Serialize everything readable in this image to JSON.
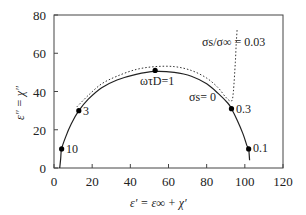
{
  "chart_data": {
    "type": "line",
    "title": "",
    "xlabel": "ε′ = ε∞ + χ′",
    "ylabel": "ε″ = χ″",
    "xlim": [
      0,
      120
    ],
    "ylim": [
      0,
      80
    ],
    "xticks": [
      0,
      20,
      40,
      60,
      80,
      100,
      120
    ],
    "yticks": [
      0,
      20,
      40,
      60,
      80
    ],
    "grid": false,
    "legend": "none",
    "series": [
      {
        "name": "σs = 0",
        "style": "solid",
        "x": [
          3,
          3.5,
          4,
          6,
          9,
          13,
          18,
          25,
          33,
          43,
          53,
          63,
          72,
          80,
          86,
          91,
          93,
          96,
          99,
          101,
          102,
          102.5
        ],
        "y": [
          0,
          5,
          10,
          16,
          23,
          30,
          36,
          42,
          46,
          49,
          50.5,
          50,
          48,
          44,
          39,
          34,
          31,
          25,
          18,
          12,
          10,
          4
        ]
      },
      {
        "name": "σs/σ∞ = 0.03",
        "style": "dotted",
        "x": [
          12,
          18,
          25,
          33,
          43,
          53,
          63,
          72,
          80,
          86,
          90,
          93,
          94,
          95,
          95.5,
          96
        ],
        "y": [
          32,
          38,
          44,
          48,
          51.5,
          53,
          53,
          51,
          47,
          42,
          37,
          35,
          40,
          55,
          65,
          73
        ]
      }
    ],
    "markers": [
      {
        "label": "10",
        "x": 4,
        "y": 10
      },
      {
        "label": "3",
        "x": 13,
        "y": 30
      },
      {
        "label": "ωτD=1",
        "x": 53,
        "y": 51
      },
      {
        "label": "0.3",
        "x": 93,
        "y": 31
      },
      {
        "label": "0.1",
        "x": 102,
        "y": 10
      }
    ],
    "annotations": [
      {
        "text": "σs/σ∞ = 0.03",
        "x": 82,
        "y": 65
      },
      {
        "text": "σs = 0",
        "x": 75,
        "y": 36
      }
    ]
  },
  "labels": {
    "x_axis": "ε′ = ε∞ + χ′",
    "y_axis": "ε″ = χ″",
    "ann_dotted_sigma": "σs/σ∞ = 0.03",
    "ann_solid_sigma": "σs= 0",
    "marker_10": "10",
    "marker_3": "3",
    "marker_1": "ωτD=1",
    "marker_03": "0.3",
    "marker_01": "0.1"
  },
  "ticks": {
    "x": [
      "0",
      "20",
      "40",
      "60",
      "80",
      "100",
      "120"
    ],
    "y": [
      "0",
      "20",
      "40",
      "60",
      "80"
    ]
  }
}
